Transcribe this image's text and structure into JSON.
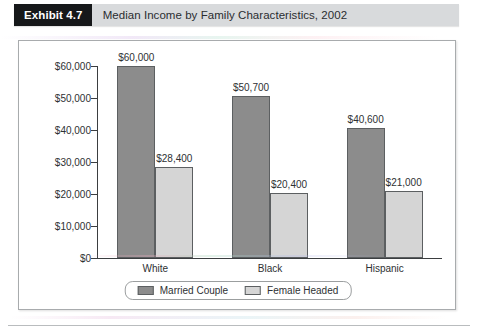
{
  "header": {
    "badge": "Exhibit 4.7",
    "title": "Median Income by Family Characteristics, 2002"
  },
  "chart_data": {
    "type": "bar",
    "title": "Median Income by Family Characteristics, 2002",
    "xlabel": "",
    "ylabel": "",
    "categories": [
      "White",
      "Black",
      "Hispanic"
    ],
    "series": [
      {
        "name": "Married Couple",
        "color": "#8c8c8c",
        "values": [
          60000,
          50700,
          40600
        ],
        "labels": [
          "$60,000",
          "$50,700",
          "$40,600"
        ]
      },
      {
        "name": "Female Headed",
        "color": "#d5d5d5",
        "values": [
          28400,
          20400,
          21000
        ],
        "labels": [
          "$28,400",
          "$20,400",
          "$21,000"
        ]
      }
    ],
    "ylim": [
      0,
      60000
    ],
    "ytick_values": [
      0,
      10000,
      20000,
      30000,
      40000,
      50000,
      60000
    ],
    "ytick_labels": [
      "$0",
      "$10,000",
      "$20,000",
      "$30,000",
      "$40,000",
      "$50,000",
      "$60,000"
    ],
    "grid": false,
    "legend_position": "bottom-center"
  }
}
